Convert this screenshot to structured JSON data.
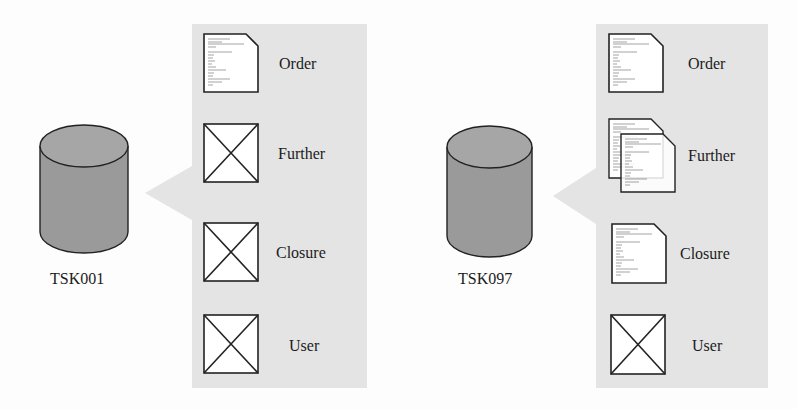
{
  "colors": {
    "background": "#fdfdfd",
    "panel": "#e4e4e4",
    "cylinder_fill": "#9a9a9a",
    "cylinder_top": "#a6a6a6",
    "stroke": "#222222",
    "icon_fill": "#ffffff"
  },
  "diagrams": [
    {
      "store": {
        "id": "TSK001",
        "icon": "database-cylinder-icon"
      },
      "items": [
        {
          "label": "Order",
          "icon": "document-icon",
          "status": "present"
        },
        {
          "label": "Further",
          "icon": "missing-placeholder-icon",
          "status": "missing"
        },
        {
          "label": "Closure",
          "icon": "missing-placeholder-icon",
          "status": "missing"
        },
        {
          "label": "User",
          "icon": "missing-placeholder-icon",
          "status": "missing"
        }
      ]
    },
    {
      "store": {
        "id": "TSK097",
        "icon": "database-cylinder-icon"
      },
      "items": [
        {
          "label": "Order",
          "icon": "document-icon",
          "status": "present"
        },
        {
          "label": "Further",
          "icon": "stacked-documents-icon",
          "status": "present-multiple"
        },
        {
          "label": "Closure",
          "icon": "document-icon",
          "status": "present"
        },
        {
          "label": "User",
          "icon": "missing-placeholder-icon",
          "status": "missing"
        }
      ]
    }
  ]
}
